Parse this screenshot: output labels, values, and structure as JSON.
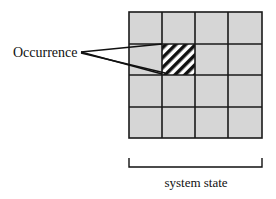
{
  "diagram": {
    "callout_label": "Occurrence",
    "bracket_label": "system state",
    "grid": {
      "rows": 4,
      "cols": 4,
      "highlighted_cell": {
        "row": 1,
        "col": 1,
        "pattern": "diagonal-hatch"
      }
    },
    "colors": {
      "cell_fill": "#d6d6d6",
      "grid_line": "#1a1a1a",
      "hatch": "#111111",
      "background": "#ffffff"
    }
  }
}
